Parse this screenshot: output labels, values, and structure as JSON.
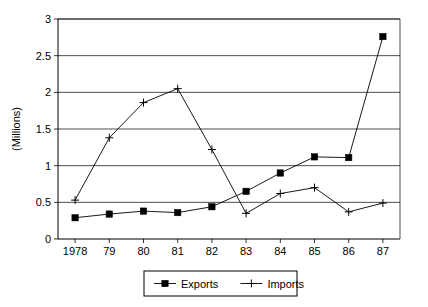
{
  "chart_data": {
    "type": "line",
    "title": "",
    "subtitle": "",
    "xlabel": "",
    "ylabel": "(Millions)",
    "categories": [
      "1978",
      "79",
      "80",
      "81",
      "82",
      "83",
      "84",
      "85",
      "86",
      "87"
    ],
    "x_values": [
      1978,
      1979,
      1980,
      1981,
      1982,
      1983,
      1984,
      1985,
      1986,
      1987
    ],
    "ylim": [
      0,
      3
    ],
    "y_ticks": [
      "0",
      "0.5",
      "1",
      "1.5",
      "2",
      "2.5",
      "3"
    ],
    "y_tick_values": [
      0,
      0.5,
      1,
      1.5,
      2,
      2.5,
      3
    ],
    "grid": "horizontal",
    "legend_position": "bottom",
    "series": [
      {
        "name": "Exports",
        "marker": "square",
        "color": "#000000",
        "values": [
          0.29,
          0.34,
          0.38,
          0.36,
          0.44,
          0.65,
          0.9,
          1.12,
          1.11,
          2.76
        ]
      },
      {
        "name": "Imports",
        "marker": "plus",
        "color": "#000000",
        "values": [
          0.53,
          1.38,
          1.86,
          2.05,
          1.22,
          0.35,
          0.62,
          0.7,
          0.37,
          0.49
        ]
      }
    ]
  },
  "legend": {
    "entries": [
      {
        "label": "Exports"
      },
      {
        "label": "Imports"
      }
    ]
  },
  "axes": {
    "y_axis_title": "(Millions)"
  }
}
